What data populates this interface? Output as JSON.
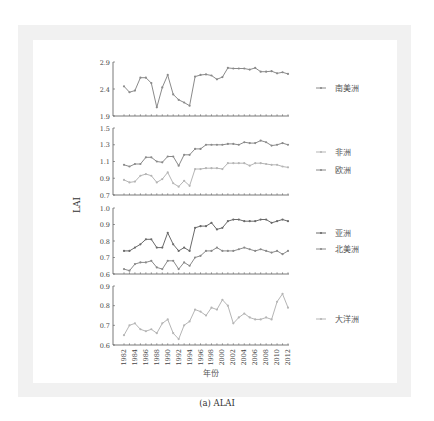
{
  "caption": "(a) ALAI",
  "chart_data": {
    "type": "line",
    "title": "",
    "xlabel": "年份",
    "ylabel": "LAI",
    "x": [
      1982,
      1983,
      1984,
      1985,
      1986,
      1987,
      1988,
      1989,
      1990,
      1991,
      1992,
      1993,
      1994,
      1995,
      1996,
      1997,
      1998,
      1999,
      2000,
      2001,
      2002,
      2003,
      2004,
      2005,
      2006,
      2007,
      2008,
      2009,
      2010,
      2011,
      2012
    ],
    "x_tick_labels": [
      "1982",
      "1984",
      "1986",
      "1988",
      "1990",
      "1992",
      "1994",
      "1996",
      "1998",
      "2000",
      "2002",
      "2004",
      "2006",
      "2008",
      "2010",
      "2012"
    ],
    "legend_position": "right",
    "grid": false,
    "panels": [
      {
        "ylim": [
          1.9,
          2.9
        ],
        "yticks": [
          "1.9",
          "2.4",
          "2.9"
        ],
        "series": [
          {
            "name": "南美洲",
            "color": "#8a8a8a",
            "values": [
              2.45,
              2.34,
              2.37,
              2.61,
              2.61,
              2.51,
              2.06,
              2.43,
              2.66,
              2.3,
              2.2,
              2.15,
              2.09,
              2.63,
              2.66,
              2.67,
              2.65,
              2.58,
              2.62,
              2.79,
              2.78,
              2.78,
              2.78,
              2.76,
              2.79,
              2.72,
              2.72,
              2.73,
              2.69,
              2.71,
              2.68
            ]
          }
        ]
      },
      {
        "ylim": [
          0.7,
          1.5
        ],
        "yticks": [
          "0.7",
          "0.9",
          "1.1",
          "1.3",
          "1.5"
        ],
        "series": [
          {
            "name": "非洲",
            "color": "#b5b5b5",
            "values": [
              0.88,
              0.85,
              0.86,
              0.93,
              0.95,
              0.93,
              0.85,
              0.89,
              0.97,
              0.84,
              0.8,
              0.87,
              0.81,
              1.01,
              1.01,
              1.02,
              1.02,
              1.02,
              1.01,
              1.08,
              1.08,
              1.08,
              1.08,
              1.05,
              1.08,
              1.08,
              1.07,
              1.06,
              1.06,
              1.04,
              1.03
            ]
          },
          {
            "name": "欧洲",
            "color": "#8a8a8a",
            "values": [
              1.06,
              1.04,
              1.07,
              1.07,
              1.15,
              1.15,
              1.1,
              1.09,
              1.16,
              1.16,
              1.05,
              1.18,
              1.18,
              1.25,
              1.25,
              1.3,
              1.3,
              1.3,
              1.3,
              1.31,
              1.31,
              1.3,
              1.33,
              1.32,
              1.32,
              1.35,
              1.33,
              1.29,
              1.3,
              1.32,
              1.3
            ]
          }
        ]
      },
      {
        "ylim": [
          0.6,
          1.0
        ],
        "yticks": [
          "0.6",
          "0.7",
          "0.8",
          "0.9",
          "1.0"
        ],
        "series": [
          {
            "name": "亚洲",
            "color": "#6a6a6a",
            "values": [
              0.74,
              0.74,
              0.76,
              0.78,
              0.81,
              0.81,
              0.76,
              0.76,
              0.85,
              0.78,
              0.74,
              0.76,
              0.74,
              0.88,
              0.89,
              0.89,
              0.91,
              0.87,
              0.88,
              0.92,
              0.93,
              0.93,
              0.92,
              0.92,
              0.92,
              0.93,
              0.93,
              0.91,
              0.92,
              0.93,
              0.92
            ]
          },
          {
            "name": "北美洲",
            "color": "#8a8a8a",
            "values": [
              0.63,
              0.62,
              0.66,
              0.67,
              0.67,
              0.68,
              0.64,
              0.63,
              0.68,
              0.68,
              0.63,
              0.67,
              0.65,
              0.7,
              0.71,
              0.74,
              0.74,
              0.76,
              0.74,
              0.74,
              0.74,
              0.75,
              0.76,
              0.75,
              0.74,
              0.75,
              0.74,
              0.73,
              0.74,
              0.72,
              0.74
            ]
          }
        ]
      },
      {
        "ylim": [
          0.6,
          0.9
        ],
        "yticks": [
          "0.6",
          "0.7",
          "0.8",
          "0.9"
        ],
        "series": [
          {
            "name": "大洋洲",
            "color": "#b5b5b5",
            "values": [
              0.65,
              0.7,
              0.71,
              0.68,
              0.67,
              0.68,
              0.66,
              0.71,
              0.73,
              0.66,
              0.63,
              0.7,
              0.72,
              0.78,
              0.77,
              0.75,
              0.79,
              0.78,
              0.83,
              0.8,
              0.71,
              0.74,
              0.76,
              0.74,
              0.73,
              0.73,
              0.74,
              0.73,
              0.82,
              0.86,
              0.79
            ]
          }
        ]
      }
    ]
  }
}
